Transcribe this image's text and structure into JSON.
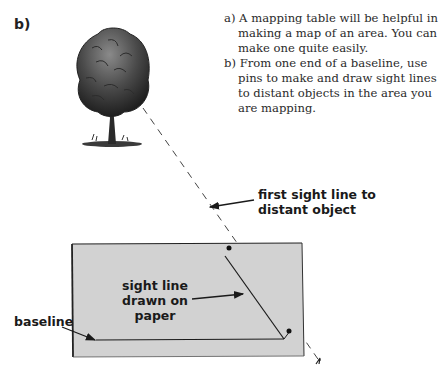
{
  "figure": {
    "panel_label": "b)",
    "caption": {
      "items": [
        "a) A mapping table will be helpful in making a map of an area. You can make one quite easily.",
        "b) From one end of a baseline, use pins to make and draw sight lines to distant objects in the area you are mapping."
      ]
    },
    "labels": {
      "first_sight_line": [
        "first sight line to",
        "distant object"
      ],
      "sight_line_drawn": [
        "sight line",
        "drawn on",
        "paper"
      ],
      "baseline": "baseline"
    },
    "colors": {
      "paper": "#d2d2d2",
      "ink": "#1a1a1a",
      "background": "#ffffff"
    }
  }
}
